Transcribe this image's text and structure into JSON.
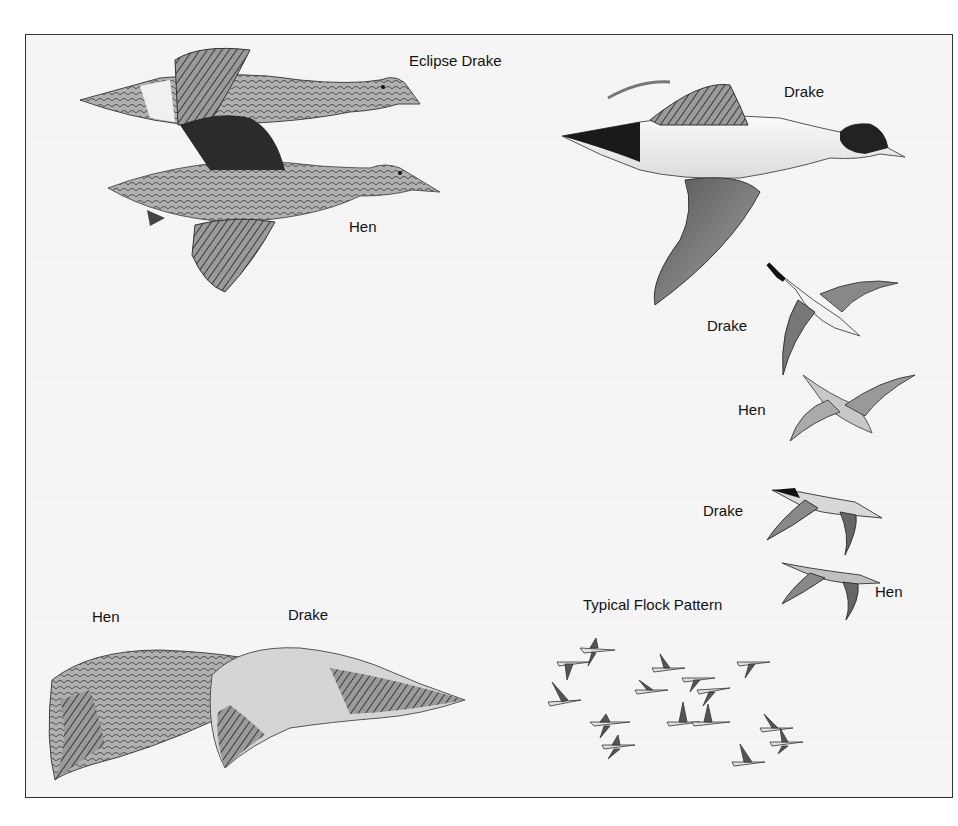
{
  "figure": {
    "labels": {
      "eclipse_drake": "Eclipse Drake",
      "hen_top": "Hen",
      "drake_top_right": "Drake",
      "drake_mid_1": "Drake",
      "hen_mid_1": "Hen",
      "drake_mid_2": "Drake",
      "hen_mid_2": "Hen",
      "flock_title": "Typical Flock Pattern",
      "wing_hen": "Hen",
      "wing_drake": "Drake"
    },
    "colors": {
      "background": "#f5f5f5",
      "border": "#333333",
      "ink_dark": "#1a1a1a",
      "ink_mid": "#777777",
      "ink_light": "#c8c8c8"
    }
  }
}
